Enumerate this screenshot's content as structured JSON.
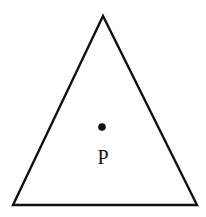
{
  "diagram": {
    "shape": "triangle",
    "point": {
      "label": "P",
      "marker": "dot"
    },
    "colors": {
      "stroke": "#111111",
      "background": "#ffffff"
    }
  }
}
